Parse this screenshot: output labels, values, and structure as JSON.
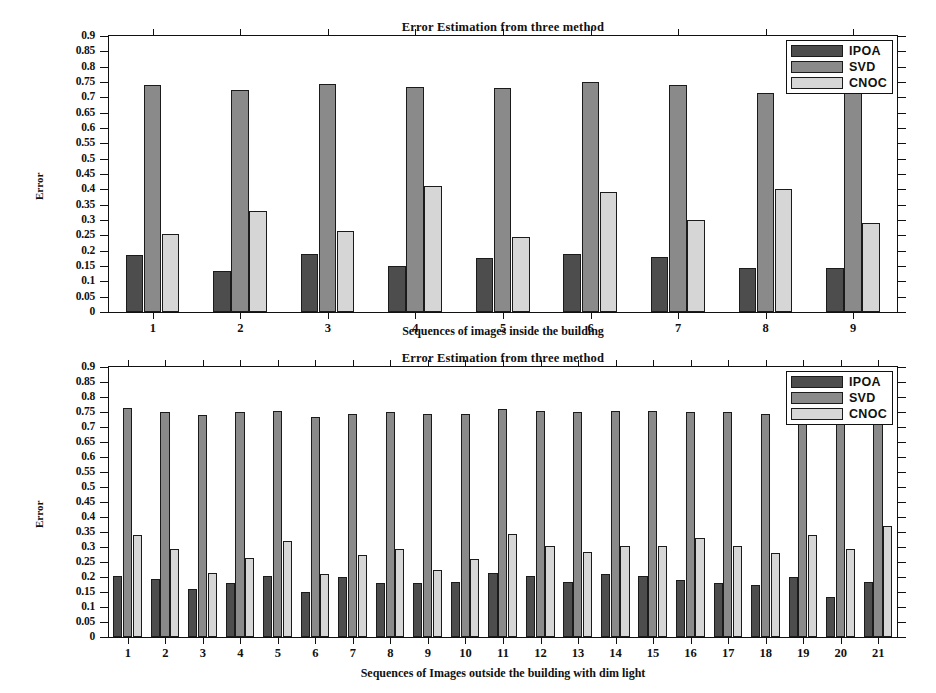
{
  "figure": {
    "background": "#ffffff"
  },
  "colors": {
    "IPOA": "#4d4d4d",
    "SVD": "#8a8a8a",
    "CNOC": "#d6d6d6",
    "axis": "#111111"
  },
  "legend": {
    "position": "top-right",
    "entries": [
      "IPOA",
      "SVD",
      "CNOC"
    ]
  },
  "chart_data": [
    {
      "id": "top",
      "type": "bar",
      "title": "Error Estimation from three method",
      "xlabel": "Sequences of images inside the building",
      "ylabel": "Error",
      "ylim": [
        0,
        0.9
      ],
      "ytick_step": 0.05,
      "yticks": [
        "0",
        "0.05",
        "0.1",
        "0.15",
        "0.2",
        "0.25",
        "0.3",
        "0.35",
        "0.4",
        "0.45",
        "0.5",
        "0.55",
        "0.6",
        "0.65",
        "0.7",
        "0.75",
        "0.8",
        "0.85",
        "0.9"
      ],
      "grid": false,
      "legend_position": "upper right",
      "categories": [
        "1",
        "2",
        "3",
        "4",
        "5",
        "6",
        "7",
        "8",
        "9"
      ],
      "series": [
        {
          "name": "IPOA",
          "values": [
            0.185,
            0.135,
            0.19,
            0.15,
            0.175,
            0.19,
            0.18,
            0.145,
            0.145
          ]
        },
        {
          "name": "SVD",
          "values": [
            0.74,
            0.725,
            0.745,
            0.735,
            0.73,
            0.75,
            0.74,
            0.715,
            0.715
          ]
        },
        {
          "name": "CNOC",
          "values": [
            0.255,
            0.33,
            0.265,
            0.41,
            0.245,
            0.39,
            0.3,
            0.4,
            0.29
          ]
        }
      ]
    },
    {
      "id": "bottom",
      "type": "bar",
      "title": "Error Estimation from three method",
      "xlabel": "Sequences of Images outside the building with dim light",
      "ylabel": "Error",
      "ylim": [
        0,
        0.9
      ],
      "ytick_step": 0.05,
      "yticks": [
        "0",
        "0.05",
        "0.1",
        "0.15",
        "0.2",
        "0.25",
        "0.3",
        "0.35",
        "0.4",
        "0.45",
        "0.5",
        "0.55",
        "0.6",
        "0.65",
        "0.7",
        "0.75",
        "0.8",
        "0.85",
        "0.9"
      ],
      "grid": false,
      "legend_position": "upper right",
      "categories": [
        "1",
        "2",
        "3",
        "4",
        "5",
        "6",
        "7",
        "8",
        "9",
        "10",
        "11",
        "12",
        "13",
        "14",
        "15",
        "16",
        "17",
        "18",
        "19",
        "20",
        "21"
      ],
      "series": [
        {
          "name": "IPOA",
          "values": [
            0.205,
            0.195,
            0.16,
            0.18,
            0.205,
            0.15,
            0.2,
            0.18,
            0.18,
            0.185,
            0.215,
            0.205,
            0.185,
            0.21,
            0.205,
            0.19,
            0.18,
            0.175,
            0.2,
            0.135,
            0.185
          ]
        },
        {
          "name": "SVD",
          "values": [
            0.765,
            0.75,
            0.74,
            0.75,
            0.755,
            0.735,
            0.745,
            0.75,
            0.745,
            0.745,
            0.76,
            0.755,
            0.75,
            0.755,
            0.755,
            0.75,
            0.75,
            0.745,
            0.76,
            0.73,
            0.755
          ]
        },
        {
          "name": "CNOC",
          "values": [
            0.34,
            0.295,
            0.215,
            0.265,
            0.32,
            0.21,
            0.275,
            0.295,
            0.225,
            0.26,
            0.345,
            0.305,
            0.285,
            0.305,
            0.305,
            0.33,
            0.305,
            0.28,
            0.34,
            0.295,
            0.37
          ]
        }
      ]
    }
  ]
}
